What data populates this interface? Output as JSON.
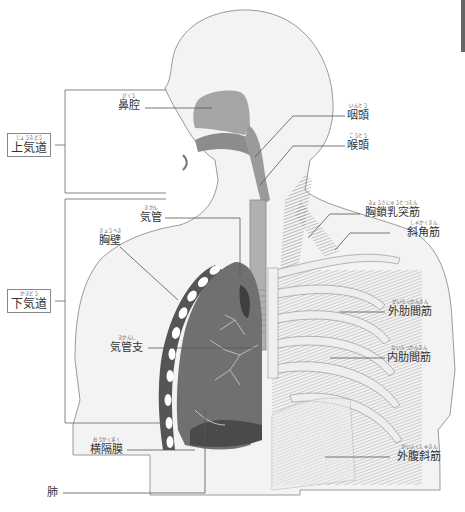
{
  "diagram": {
    "colors": {
      "body_fill": "#f2f2f2",
      "body_stroke": "#999999",
      "airway_fill": "#9a9a9a",
      "lung_fill": "#6e6e6e",
      "lung_dark": "#4a4a4a",
      "muscle_fill": "#7a7a7a",
      "rib_fill": "#ececec",
      "leader_line": "#555555"
    },
    "groups": [
      {
        "id": "upper-airway",
        "label": "上気道",
        "ruby": "じょうきどう"
      },
      {
        "id": "lower-airway",
        "label": "下気道",
        "ruby": "かきどう"
      }
    ],
    "labels": [
      {
        "id": "nasal-cavity",
        "label": "鼻腔",
        "ruby": "びくう"
      },
      {
        "id": "pharynx",
        "label": "咽頭",
        "ruby": "いんとう"
      },
      {
        "id": "larynx",
        "label": "喉頭",
        "ruby": "こうとう"
      },
      {
        "id": "trachea",
        "label": "気管",
        "ruby": "きかん"
      },
      {
        "id": "chest-wall",
        "label": "胸壁",
        "ruby": "きょうへき"
      },
      {
        "id": "sternocleidomastoid",
        "label": "胸鎖乳突筋",
        "ruby": "きょうさにゅうとつきん"
      },
      {
        "id": "scalene",
        "label": "斜角筋",
        "ruby": "しゃかくきん"
      },
      {
        "id": "external-intercostal",
        "label": "外肋間筋",
        "ruby": "がいろっかんきん"
      },
      {
        "id": "bronchi",
        "label": "気管支",
        "ruby": "きかんし"
      },
      {
        "id": "internal-intercostal",
        "label": "内肋間筋",
        "ruby": "ないろっかんきん"
      },
      {
        "id": "diaphragm",
        "label": "横隔膜",
        "ruby": "おうかくまく"
      },
      {
        "id": "external-oblique",
        "label": "外腹斜筋",
        "ruby": "がいふくしゃきん"
      },
      {
        "id": "lung",
        "label": "肺",
        "ruby": ""
      }
    ]
  }
}
